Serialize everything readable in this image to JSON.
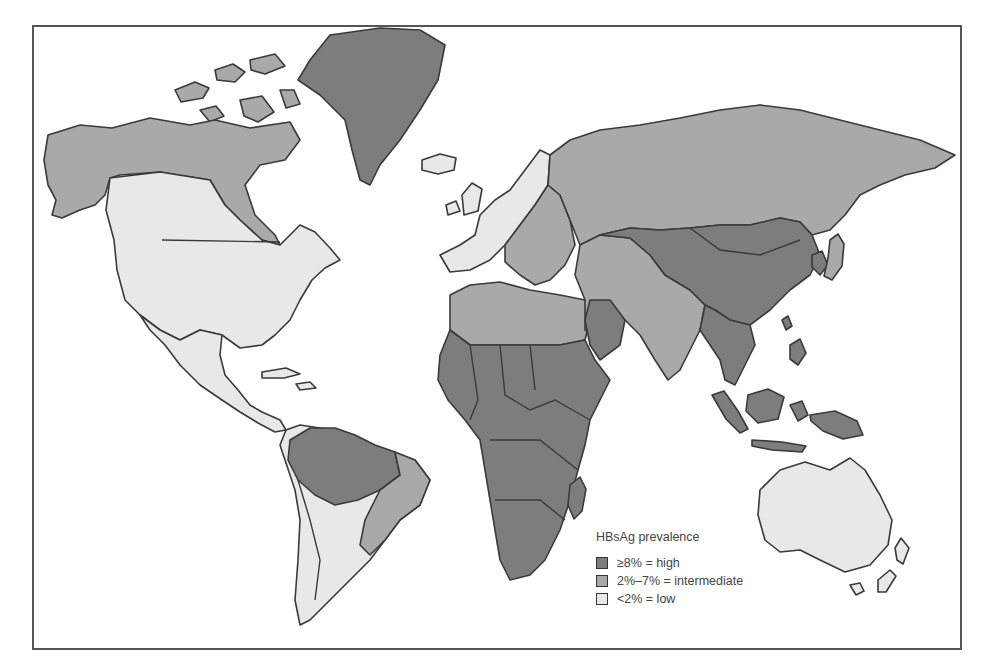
{
  "map": {
    "title": "HBsAg prevalence",
    "colors": {
      "high": "#7d7d7d",
      "intermediate": "#a9a9a9",
      "low": "#e8e8e8",
      "border": "#3a3a3a",
      "water": "#ffffff"
    },
    "regions": [
      {
        "name": "Greenland",
        "category": "high"
      },
      {
        "name": "Alaska / Northern Canada",
        "category": "intermediate"
      },
      {
        "name": "Canada (south) / USA",
        "category": "low"
      },
      {
        "name": "Mexico / Central America",
        "category": "low"
      },
      {
        "name": "Amazon basin (South America)",
        "category": "high"
      },
      {
        "name": "Eastern Brazil",
        "category": "intermediate"
      },
      {
        "name": "Southern South America",
        "category": "low"
      },
      {
        "name": "Western Europe",
        "category": "low"
      },
      {
        "name": "Eastern / Southern Europe",
        "category": "intermediate"
      },
      {
        "name": "Russia / Northern Asia",
        "category": "intermediate"
      },
      {
        "name": "North Africa",
        "category": "intermediate"
      },
      {
        "name": "Sub-Saharan Africa",
        "category": "high"
      },
      {
        "name": "Middle East / India",
        "category": "intermediate"
      },
      {
        "name": "Central Asia / China / Mongolia",
        "category": "high"
      },
      {
        "name": "Southeast Asia",
        "category": "high"
      },
      {
        "name": "Japan",
        "category": "intermediate"
      },
      {
        "name": "Indonesia / New Guinea",
        "category": "high"
      },
      {
        "name": "Australia",
        "category": "low"
      },
      {
        "name": "New Zealand",
        "category": "low"
      },
      {
        "name": "Madagascar",
        "category": "high"
      }
    ]
  },
  "legend": {
    "title": "HBsAg prevalence",
    "items": [
      {
        "label": "≥8% = high",
        "category": "high",
        "color": "#7d7d7d"
      },
      {
        "label": "2%–7% = intermediate",
        "category": "intermediate",
        "color": "#a9a9a9"
      },
      {
        "label": "<2% = low",
        "category": "low",
        "color": "#e8e8e8"
      }
    ]
  }
}
